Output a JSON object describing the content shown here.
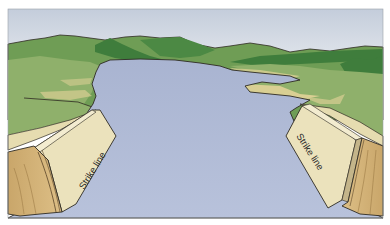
{
  "figure": {
    "labels": {
      "left_block": "Strike line",
      "right_block": "Strike line"
    },
    "colors": {
      "background": "#ffffff",
      "sky_top": "#c3ccda",
      "sky_bottom": "#eef1f4",
      "lake": "#aab5d2",
      "lake_light": "#bcc6dd",
      "hill_dark": "#3f7d3c",
      "hill_mid": "#6f9d55",
      "field_light": "#93b46d",
      "shore_sand": "#d9cf93",
      "block_face": "#ebe2bc",
      "block_side": "#d4b47a",
      "block_side_dark": "#b9955b",
      "outline": "#2e2a22"
    }
  }
}
